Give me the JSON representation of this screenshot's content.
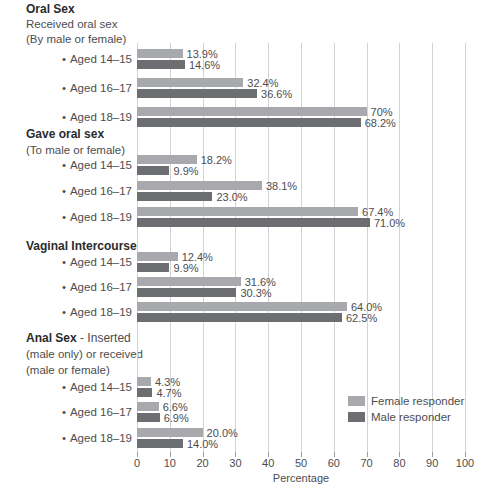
{
  "chart_data": {
    "type": "bar",
    "orientation": "horizontal",
    "title": "",
    "xlabel": "Percentage",
    "xlim": [
      0,
      100
    ],
    "xticks": [
      0,
      10,
      20,
      30,
      40,
      50,
      60,
      70,
      80,
      90,
      100
    ],
    "grid": true,
    "bullet": "•",
    "legend": {
      "position": "lower-right",
      "items": [
        {
          "label": "Female responder",
          "color": "#a7a9ac"
        },
        {
          "label": "Male responder",
          "color": "#6d6e71"
        }
      ]
    },
    "colors": {
      "female_bar": "#a7a9ac",
      "male_bar": "#6d6e71",
      "gridline": "#d1d3d4",
      "text": "#4d4d4f",
      "heading": "#2b2b2d"
    },
    "sections": [
      {
        "title": "Oral Sex",
        "title_suffix": "",
        "subtitles": [
          "Received oral sex",
          "(By male or female)"
        ],
        "groups": [
          {
            "label": "Aged 14–15",
            "female": 13.9,
            "male": 14.6,
            "female_label": "13.9%",
            "male_label": "14.6%"
          },
          {
            "label": "Aged 16–17",
            "female": 32.4,
            "male": 36.6,
            "female_label": "32.4%",
            "male_label": "36.6%"
          },
          {
            "label": "Aged 18–19",
            "female": 70,
            "male": 68.2,
            "female_label": "70%",
            "male_label": "68.2%"
          }
        ]
      },
      {
        "title": "Gave oral sex",
        "title_suffix": "",
        "subtitles": [
          "(To male or female)"
        ],
        "groups": [
          {
            "label": "Aged 14–15",
            "female": 18.2,
            "male": 9.9,
            "female_label": "18.2%",
            "male_label": "9.9%"
          },
          {
            "label": "Aged 16–17",
            "female": 38.1,
            "male": 23.0,
            "female_label": "38.1%",
            "male_label": "23.0%"
          },
          {
            "label": "Aged 18–19",
            "female": 67.4,
            "male": 71.0,
            "female_label": "67.4%",
            "male_label": "71.0%"
          }
        ]
      },
      {
        "title": "Vaginal Intercourse",
        "title_suffix": "",
        "subtitles": [],
        "groups": [
          {
            "label": "Aged 14–15",
            "female": 12.4,
            "male": 9.9,
            "female_label": "12.4%",
            "male_label": "9.9%"
          },
          {
            "label": "Aged 16–17",
            "female": 31.6,
            "male": 30.3,
            "female_label": "31.6%",
            "male_label": "30.3%"
          },
          {
            "label": "Aged 18–19",
            "female": 64.0,
            "male": 62.5,
            "female_label": "64.0%",
            "male_label": "62.5%"
          }
        ]
      },
      {
        "title": "Anal Sex",
        "title_suffix": " - Inserted",
        "subtitles": [
          "(male only) or received",
          "(male or female)"
        ],
        "groups": [
          {
            "label": "Aged 14–15",
            "female": 4.3,
            "male": 4.7,
            "female_label": "4.3%",
            "male_label": "4.7%"
          },
          {
            "label": "Aged 16–17",
            "female": 6.6,
            "male": 6.9,
            "female_label": "6.6%",
            "male_label": "6.9%"
          },
          {
            "label": "Aged 18–19",
            "female": 20.0,
            "male": 14.0,
            "female_label": "20.0%",
            "male_label": "14.0%"
          }
        ]
      }
    ]
  }
}
